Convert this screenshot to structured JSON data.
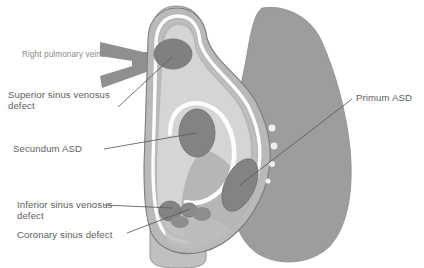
{
  "figure": {
    "background_color": "#ffffff"
  },
  "labels": [
    {
      "id": "right-pulmonary-veins",
      "text": "Right pulmonary veins",
      "style": "small",
      "color": "#8a8a8a"
    },
    {
      "id": "superior-sinus-venosus-defect",
      "text": "Superior sinus venosus\ndefect",
      "style": "main",
      "color": "#5e5e5e"
    },
    {
      "id": "secundum-asd",
      "text": "Secundum ASD",
      "style": "main",
      "color": "#5e5e5e"
    },
    {
      "id": "inferior-sinus-venosus-defect",
      "text": "Inferior sinus venosus\ndefect",
      "style": "main",
      "color": "#5e5e5e"
    },
    {
      "id": "coronary-sinus-defect",
      "text": "Coronary sinus defect",
      "style": "main",
      "color": "#5e5e5e"
    },
    {
      "id": "primum-asd",
      "text": "Primum ASD",
      "style": "main",
      "color": "#5e5e5e"
    }
  ],
  "anatomy": {
    "palette": {
      "septum_light": "#d2d2d2",
      "atrium_wall": "#b9b9b9",
      "outer_muscle": "#9d9d9d",
      "vein_gray": "#8f8f8f",
      "defect_dark": "#808080",
      "highlight_white": "#fdfdfd",
      "outline": "#7a7a7a"
    },
    "structures": [
      {
        "name": "superior-vena-cava",
        "fill": "#b9b9b9"
      },
      {
        "name": "inferior-vena-cava",
        "fill": "#b9b9b9"
      },
      {
        "name": "right-pulmonary-veins-trunk",
        "fill": "#8f8f8f"
      },
      {
        "name": "interatrial-septum",
        "fill": "#d2d2d2"
      },
      {
        "name": "right-ventricle-mass",
        "fill": "#9d9d9d"
      },
      {
        "name": "fossa-ovalis-limbus",
        "fill": "#fdfdfd"
      },
      {
        "name": "superior-sinus-venosus-defect-oval",
        "fill": "#808080"
      },
      {
        "name": "secundum-asd-oval",
        "fill": "#808080"
      },
      {
        "name": "primum-asd-oval",
        "fill": "#808080"
      },
      {
        "name": "inferior-sinus-venosus-defect-oval",
        "fill": "#808080"
      },
      {
        "name": "coronary-sinus-defect-oval",
        "fill": "#808080"
      },
      {
        "name": "thebesian-ostia-cluster",
        "fill": "#8a8a8a"
      }
    ]
  }
}
